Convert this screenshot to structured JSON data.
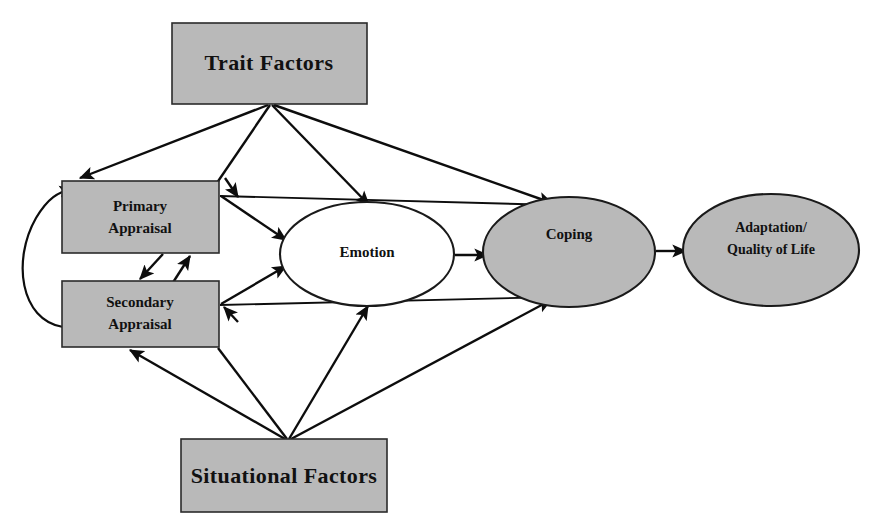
{
  "diagram": {
    "canvas": {
      "width": 881,
      "height": 529,
      "background": "#ffffff"
    },
    "palette": {
      "node_fill_gray": "#b9b9b9",
      "node_fill_white": "#ffffff",
      "stroke": "#0d0d0d",
      "text": "#111111"
    },
    "nodes": [
      {
        "id": "trait-factors",
        "label": "Trait Factors",
        "shape": "rectangle",
        "fill": "#b9b9b9",
        "x": 172,
        "y": 23,
        "width": 195,
        "height": 81
      },
      {
        "id": "primary-appraisal",
        "label_line1": "Primary",
        "label_line2": "Appraisal",
        "shape": "rectangle",
        "fill": "#b9b9b9",
        "x": 62,
        "y": 181,
        "width": 157,
        "height": 72
      },
      {
        "id": "secondary-appraisal",
        "label_line1": "Secondary",
        "label_line2": "Appraisal",
        "shape": "rectangle",
        "fill": "#b9b9b9",
        "x": 62,
        "y": 281,
        "width": 157,
        "height": 66
      },
      {
        "id": "emotion",
        "label": "Emotion",
        "shape": "ellipse",
        "fill": "#ffffff",
        "cx": 367,
        "cy": 254,
        "rx": 87,
        "ry": 52
      },
      {
        "id": "coping",
        "label": "Coping",
        "shape": "ellipse",
        "fill": "#b9b9b9",
        "cx": 569,
        "cy": 252,
        "rx": 86,
        "ry": 55
      },
      {
        "id": "adaptation-quality-of-life",
        "label_line1": "Adaptation/",
        "label_line2": "Quality of Life",
        "shape": "ellipse",
        "fill": "#b9b9b9",
        "cx": 771,
        "cy": 250,
        "rx": 88,
        "ry": 56
      },
      {
        "id": "situational-factors",
        "label": "Situational Factors",
        "shape": "rectangle",
        "fill": "#b9b9b9",
        "x": 181,
        "y": 439,
        "width": 206,
        "height": 73
      }
    ],
    "edges": [
      {
        "id": "trait-to-primary",
        "from": "trait-factors",
        "to": "primary-appraisal",
        "style": "straight-arrow"
      },
      {
        "id": "trait-to-secondary",
        "from": "trait-factors",
        "to": "secondary-appraisal",
        "style": "straight-arrow"
      },
      {
        "id": "trait-to-emotion",
        "from": "trait-factors",
        "to": "emotion",
        "style": "straight-arrow"
      },
      {
        "id": "trait-to-coping",
        "from": "trait-factors",
        "to": "coping",
        "style": "straight-arrow"
      },
      {
        "id": "primary-to-secondary",
        "from": "primary-appraisal",
        "to": "secondary-appraisal",
        "style": "straight-arrow"
      },
      {
        "id": "secondary-to-primary",
        "from": "secondary-appraisal",
        "to": "primary-appraisal",
        "style": "straight-arrow"
      },
      {
        "id": "secondary-to-primary-feedback",
        "from": "secondary-appraisal",
        "to": "primary-appraisal",
        "style": "curved-arrow"
      },
      {
        "id": "primary-to-emotion",
        "from": "primary-appraisal",
        "to": "emotion",
        "style": "straight-arrow"
      },
      {
        "id": "secondary-to-emotion",
        "from": "secondary-appraisal",
        "to": "emotion",
        "style": "straight-arrow"
      },
      {
        "id": "primary-to-coping",
        "from": "primary-appraisal",
        "to": "coping",
        "style": "straight-arrow"
      },
      {
        "id": "secondary-to-coping",
        "from": "secondary-appraisal",
        "to": "coping",
        "style": "straight-arrow"
      },
      {
        "id": "emotion-to-coping",
        "from": "emotion",
        "to": "coping",
        "style": "straight-arrow"
      },
      {
        "id": "coping-to-adaptation",
        "from": "coping",
        "to": "adaptation-quality-of-life",
        "style": "straight-arrow"
      },
      {
        "id": "situational-to-secondary",
        "from": "situational-factors",
        "to": "secondary-appraisal",
        "style": "straight-arrow"
      },
      {
        "id": "situational-to-secondary-right",
        "from": "situational-factors",
        "to": "secondary-appraisal",
        "style": "straight-arrow"
      },
      {
        "id": "situational-to-emotion",
        "from": "situational-factors",
        "to": "emotion",
        "style": "straight-arrow"
      },
      {
        "id": "situational-to-coping",
        "from": "situational-factors",
        "to": "coping",
        "style": "straight-arrow"
      }
    ]
  }
}
